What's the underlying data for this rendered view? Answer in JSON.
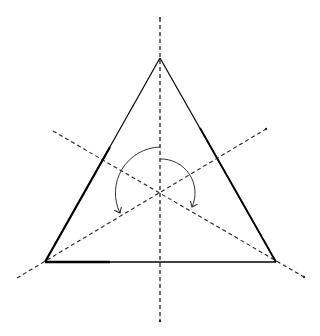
{
  "diagram": {
    "title": "Rotational symmetry of an equilateral triangle",
    "triangle": {
      "apex": [
        160,
        58
      ],
      "base_left": [
        45,
        262
      ],
      "base_right": [
        276,
        262
      ],
      "stroke": "#000000"
    },
    "center": [
      160,
      193
    ],
    "symmetry_axes": [
      {
        "name": "vertical-axis",
        "from": [
          160,
          18
        ],
        "to": [
          160,
          321
        ]
      },
      {
        "name": "axis-left-down",
        "from": [
          53,
          131
        ],
        "to": [
          304,
          277
        ]
      },
      {
        "name": "axis-right-up",
        "from": [
          17,
          278
        ],
        "to": [
          266,
          129
        ]
      }
    ],
    "rotation_arrows": [
      {
        "name": "rotation-arrow-240",
        "label": "240° rotation"
      },
      {
        "name": "rotation-arrow-120",
        "label": "120° rotation"
      }
    ],
    "colors": {
      "line": "#000000",
      "dashed": "#222222",
      "background": "#ffffff"
    }
  }
}
